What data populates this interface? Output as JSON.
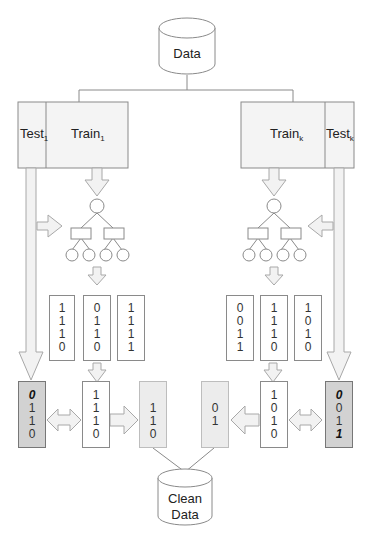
{
  "diagram": {
    "source_db": {
      "label": "Data"
    },
    "clean_db": {
      "label_line1": "Clean",
      "label_line2": "Data"
    },
    "left_partition": {
      "test": {
        "label": "Test",
        "subscript": "1"
      },
      "train": {
        "label": "Train",
        "subscript": "1"
      }
    },
    "right_partition": {
      "train": {
        "label": "Train",
        "subscript": "k"
      },
      "test": {
        "label": "Test",
        "subscript": "k"
      }
    },
    "left_prediction_vectors": [
      [
        "1",
        "1",
        "1",
        "0"
      ],
      [
        "0",
        "1",
        "1",
        "0"
      ],
      [
        "1",
        "1",
        "1",
        "1"
      ]
    ],
    "right_prediction_vectors": [
      [
        "0",
        "0",
        "1",
        "1"
      ],
      [
        "1",
        "1",
        "1",
        "0"
      ],
      [
        "1",
        "0",
        "1",
        "0"
      ]
    ],
    "left_test_labels": [
      "0",
      "1",
      "1",
      "0"
    ],
    "left_test_labels_bold": [
      true,
      false,
      false,
      false
    ],
    "left_selected_vector": [
      "1",
      "1",
      "1",
      "0"
    ],
    "left_clean_result": [
      "1",
      "1",
      "0"
    ],
    "right_clean_result": [
      "0",
      "1"
    ],
    "right_selected_vector": [
      "1",
      "0",
      "1",
      "0"
    ],
    "right_test_labels": [
      "0",
      "0",
      "1",
      "1"
    ],
    "right_test_labels_bold": [
      true,
      false,
      false,
      true
    ],
    "colors": {
      "stroke": "#8a8a8a",
      "arrow_fill": "#f2f2f2",
      "arrow_stroke": "#a8a8a8",
      "test_label_fill": "#d2d2d2",
      "clean_result_fill": "#ececec"
    }
  }
}
